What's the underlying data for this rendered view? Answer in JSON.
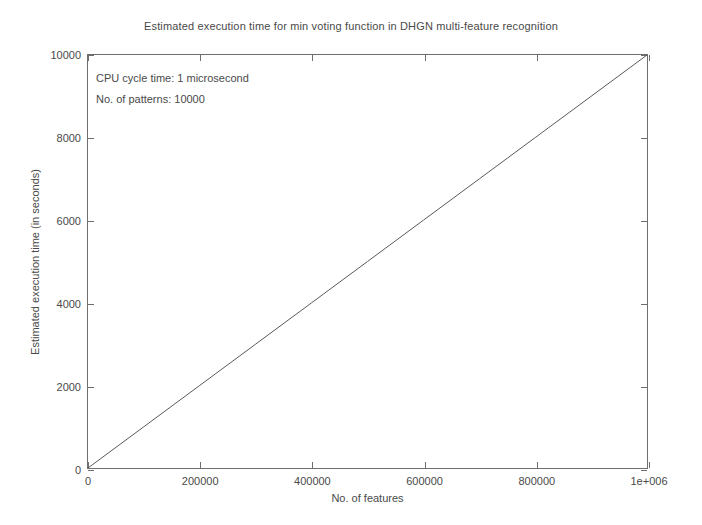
{
  "chart_data": {
    "type": "line",
    "title": "Estimated execution time for min voting function in DHGN multi-feature recognition",
    "xlabel": "No. of features",
    "ylabel": "Estimated execution time (in seconds)",
    "xlim": [
      0,
      1000000
    ],
    "ylim": [
      0,
      10000
    ],
    "grid": false,
    "legend": "none",
    "xticks": [
      0,
      200000,
      400000,
      600000,
      800000,
      1000000
    ],
    "xticklabels": [
      "0",
      "200000",
      "400000",
      "600000",
      "800000",
      "1e+006"
    ],
    "yticks": [
      0,
      2000,
      4000,
      6000,
      8000,
      10000
    ],
    "yticklabels": [
      "0",
      "2000",
      "4000",
      "6000",
      "8000",
      "10000"
    ],
    "series": [
      {
        "name": "Estimated execution time",
        "color": "#5a5a5a",
        "x": [
          0,
          100000,
          200000,
          300000,
          400000,
          500000,
          600000,
          700000,
          800000,
          900000,
          1000000
        ],
        "values": [
          0,
          1000,
          2000,
          3000,
          4000,
          5000,
          6000,
          7000,
          8000,
          9000,
          10000
        ]
      }
    ],
    "annotations": [
      "CPU cycle time: 1 microsecond",
      "No. of patterns: 10000"
    ]
  }
}
